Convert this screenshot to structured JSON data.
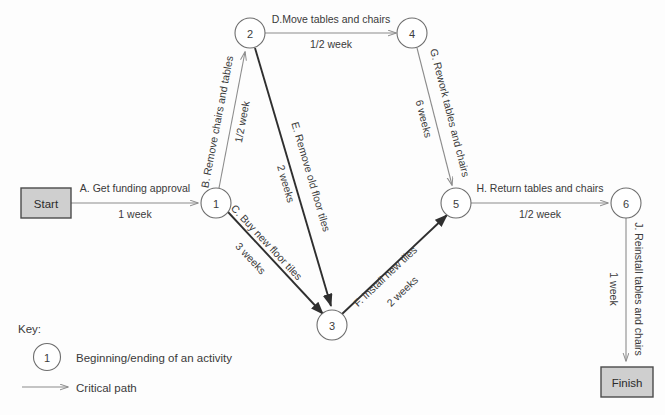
{
  "diagram": {
    "type": "project-network-diagram",
    "terminals": [
      {
        "id": "start",
        "label": "Start",
        "x": 46,
        "y": 203,
        "w": 50,
        "h": 30
      },
      {
        "id": "finish",
        "label": "Finish",
        "x": 627,
        "y": 382,
        "w": 52,
        "h": 30
      }
    ],
    "nodes": [
      {
        "id": "1",
        "label": "1",
        "x": 216,
        "y": 203,
        "r": 15
      },
      {
        "id": "2",
        "label": "2",
        "x": 250,
        "y": 33,
        "r": 15
      },
      {
        "id": "3",
        "label": "3",
        "x": 332,
        "y": 325,
        "r": 15
      },
      {
        "id": "4",
        "label": "4",
        "x": 412,
        "y": 33,
        "r": 15
      },
      {
        "id": "5",
        "label": "5",
        "x": 456,
        "y": 203,
        "r": 15
      },
      {
        "id": "6",
        "label": "6",
        "x": 626,
        "y": 203,
        "r": 15
      }
    ],
    "edges": [
      {
        "id": "A",
        "from": "start",
        "to": "1",
        "name": "A. Get funding approval",
        "duration": "1 week",
        "critical": false
      },
      {
        "id": "B",
        "from": "1",
        "to": "2",
        "name": "B. Remove chairs and tables",
        "duration": "1/2 week",
        "critical": false
      },
      {
        "id": "C",
        "from": "1",
        "to": "3",
        "name": "C. Buy new floor tiles",
        "duration": "3 weeks",
        "critical": true
      },
      {
        "id": "D",
        "from": "2",
        "to": "4",
        "name": "D.Move tables and chairs",
        "duration": "1/2 week",
        "critical": false
      },
      {
        "id": "E",
        "from": "2",
        "to": "3",
        "name": "E. Remove old floor tiles",
        "duration": "2 weeks",
        "critical": true
      },
      {
        "id": "F",
        "from": "3",
        "to": "5",
        "name": "F. Install new tiles",
        "duration": "2 weeks",
        "critical": true
      },
      {
        "id": "G",
        "from": "4",
        "to": "5",
        "name": "G. Rework tables and chairs",
        "duration": "6 weeks",
        "critical": false
      },
      {
        "id": "H",
        "from": "5",
        "to": "6",
        "name": "H. Return tables and chairs",
        "duration": "1/2 week",
        "critical": false
      },
      {
        "id": "J",
        "from": "6",
        "to": "finish",
        "name": "J. Reinstall tables and chairs",
        "duration": "1 week",
        "critical": false
      }
    ]
  },
  "key": {
    "title": "Key:",
    "node_symbol_label": "1",
    "node_meaning": "Beginning/ending of an activity",
    "arrow_meaning": "Critical path"
  },
  "colors": {
    "terminal_fill": "#cfcfcf",
    "terminal_stroke": "#4a4a4a",
    "node_stroke": "#6e6e6e",
    "edge_thin": "#8c8c8c",
    "edge_bold": "#2f2f2f",
    "text": "#3a3a3a",
    "background": "#fdfdfd"
  }
}
